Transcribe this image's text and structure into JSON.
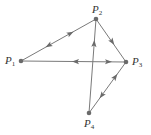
{
  "diagram": {
    "type": "directed-graph",
    "colors": {
      "edge": "#7a7a7a",
      "node": "#6a6a6a",
      "label": "#333333"
    },
    "nodes": [
      {
        "id": "P1",
        "letter": "P",
        "sub": "1",
        "x": 21,
        "y": 61
      },
      {
        "id": "P2",
        "letter": "P",
        "sub": "2",
        "x": 96,
        "y": 19
      },
      {
        "id": "P3",
        "letter": "P",
        "sub": "3",
        "x": 126,
        "y": 62
      },
      {
        "id": "P4",
        "letter": "P",
        "sub": "4",
        "x": 89,
        "y": 113
      }
    ],
    "edges": [
      {
        "from": "P1",
        "to": "P2",
        "direction": "both"
      },
      {
        "from": "P1",
        "to": "P3",
        "direction": "both"
      },
      {
        "from": "P2",
        "to": "P3",
        "direction": "forward"
      },
      {
        "from": "P4",
        "to": "P2",
        "direction": "forward"
      },
      {
        "from": "P3",
        "to": "P4",
        "direction": "both"
      }
    ]
  }
}
